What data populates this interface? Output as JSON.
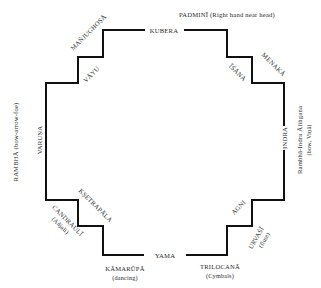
{
  "diagram": {
    "type": "stepped-mandala-plan",
    "line_color": "#111111",
    "directions": {
      "north": "KUBERA",
      "northwest": "VĀYU",
      "west": "VARUṆA",
      "southwest": "KṢETRAPĀLA",
      "south": "YAMA",
      "southeast": "AGNI",
      "east": "INDRA",
      "northeast": "ĪŚĀNA"
    },
    "figures": {
      "padmini": "PADMINĪ (Right hand near head)",
      "manjughosa": "MAÑJUGHOṢĀ",
      "menaka": "MENAKĀ",
      "rambha_west": "RAMBHĀ (bow-arrow-foe)",
      "rambha_east_line1": "Rambhā-Indra Āliṅgana",
      "rambha_east_line2": "(bow, Viṇā)",
      "candrauli_line1": "CANDRAULĪ",
      "candrauli_line2": "(Añjali)",
      "kamarupa_line1": "KĀMARŪPĀ",
      "kamarupa_line2": "(dancing)",
      "trilocana_line1": "TRILOCANĀ",
      "trilocana_line2": "(Cymbals)",
      "urvasi_line1": "URVAŚĪ",
      "urvasi_line2": "(flute)"
    }
  }
}
